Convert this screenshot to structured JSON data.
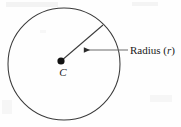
{
  "figure": {
    "type": "geometry-diagram",
    "background_color": "#fefefe",
    "stroke_color": "#2b2b2b",
    "labels": {
      "center_point": "C",
      "radius_text": "Radius (",
      "radius_variable": "r",
      "radius_text_close": ")"
    },
    "geometry": {
      "circle_center_x": 64,
      "circle_center_y": 64,
      "circle_radius": 56,
      "center_dot_x": 61,
      "center_dot_y": 61,
      "center_dot_radius": 3.6,
      "radius_line_end_x": 103,
      "radius_line_end_y": 25,
      "arrow_tail_x": 128,
      "arrow_tip_x": 83,
      "arrow_y": 50
    }
  }
}
